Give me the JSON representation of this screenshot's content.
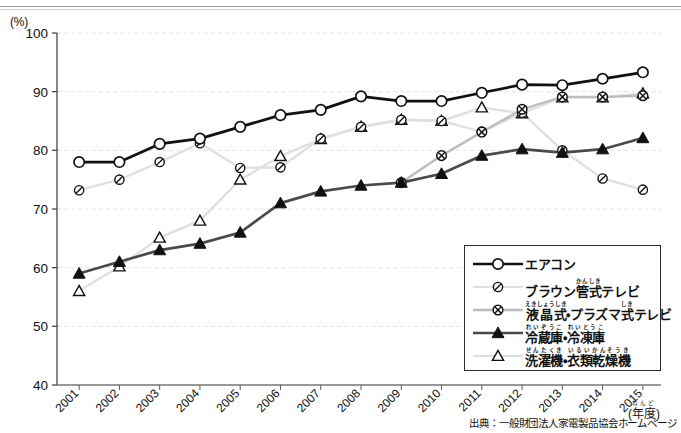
{
  "axis": {
    "unit_label": "(%)",
    "y_ticks": [
      "100",
      "90",
      "80",
      "70",
      "60",
      "50",
      "40"
    ],
    "x_axis_caption": "(年度)",
    "x_axis_caption_ruby": "ねんど"
  },
  "source_note": "出典：一般財団法人家電製品協会ホームページ",
  "legend": {
    "items": [
      {
        "name": "エアコン",
        "ruby_html": "エアコン",
        "marker": "open-circle",
        "line_color": "#111111",
        "line_width": 2.6,
        "marker_fill": "#ffffff",
        "marker_stroke": "#111111"
      },
      {
        "name": "ブラウン管式テレビ",
        "ruby_html": "ブラウン<ruby>管式<rt>かんしき</rt></ruby>テレビ",
        "marker": "circle-slash",
        "line_color": "#e0e0e0",
        "line_width": 2.4,
        "marker_fill": "#ffffff",
        "marker_stroke": "#111111"
      },
      {
        "name": "液晶式・プラズマ式テレビ",
        "ruby_html": "<ruby>液晶式<rt>えきしょうしき</rt></ruby>・プラズマ<ruby>式<rt>しき</rt></ruby>テレビ",
        "marker": "circle-cross",
        "line_color": "#bdbdbd",
        "line_width": 2.4,
        "marker_fill": "#ffffff",
        "marker_stroke": "#111111"
      },
      {
        "name": "冷蔵庫・冷凍庫",
        "ruby_html": "<ruby>冷蔵庫<rt>れいぞうこ</rt></ruby>・<ruby>冷凍庫<rt>れいとうこ</rt></ruby>",
        "marker": "filled-triangle",
        "line_color": "#4a4a4a",
        "line_width": 2.6,
        "marker_fill": "#111111",
        "marker_stroke": "#111111"
      },
      {
        "name": "洗濯機・衣類乾燥機",
        "ruby_html": "<ruby>洗濯機<rt>せんたくき</rt></ruby>・<ruby>衣類乾燥機<rt>いるいかんそうき</rt></ruby>",
        "marker": "open-triangle",
        "line_color": "#e0e0e0",
        "line_width": 2.4,
        "marker_fill": "#ffffff",
        "marker_stroke": "#111111"
      }
    ]
  },
  "chart_data": {
    "type": "line",
    "title": "",
    "xlabel": "(年度)",
    "ylabel": "(%)",
    "ylim": [
      40,
      100
    ],
    "ytick_step": 10,
    "grid": true,
    "legend_position": "inside-bottom-right",
    "categories": [
      "2001",
      "2002",
      "2003",
      "2004",
      "2005",
      "2006",
      "2007",
      "2008",
      "2009",
      "2010",
      "2011",
      "2012",
      "2013",
      "2014",
      "2015"
    ],
    "series": [
      {
        "name": "エアコン",
        "marker": "open-circle",
        "color": "#111111",
        "values": [
          78.0,
          78.0,
          81.1,
          82.0,
          84.0,
          86.0,
          86.9,
          89.2,
          88.4,
          88.4,
          89.8,
          91.2,
          91.1,
          92.2,
          93.3
        ]
      },
      {
        "name": "ブラウン管式テレビ",
        "marker": "circle-slash",
        "color": "#e0e0e0",
        "values": [
          73.2,
          75.0,
          78.0,
          81.2,
          77.0,
          77.1,
          82.0,
          84.0,
          85.2,
          85.0,
          83.2,
          86.4,
          80.0,
          75.2,
          73.3
        ]
      },
      {
        "name": "液晶式・プラズマ式テレビ",
        "marker": "circle-cross",
        "color": "#bdbdbd",
        "values": [
          null,
          null,
          null,
          null,
          null,
          null,
          null,
          null,
          74.5,
          79.1,
          83.1,
          87.0,
          89.1,
          89.1,
          89.3
        ]
      },
      {
        "name": "冷蔵庫・冷凍庫",
        "marker": "filled-triangle",
        "color": "#4a4a4a",
        "values": [
          59.0,
          61.0,
          63.0,
          64.1,
          66.0,
          71.0,
          73.0,
          74.0,
          74.5,
          76.0,
          79.1,
          80.2,
          79.6,
          80.2,
          82.1
        ]
      },
      {
        "name": "洗濯機・衣類乾燥機",
        "marker": "open-triangle",
        "color": "#e0e0e0",
        "values": [
          56.0,
          60.2,
          65.1,
          68.0,
          75.0,
          79.0,
          81.9,
          84.0,
          85.2,
          85.0,
          87.3,
          86.3,
          89.0,
          89.0,
          89.7
        ]
      }
    ]
  }
}
